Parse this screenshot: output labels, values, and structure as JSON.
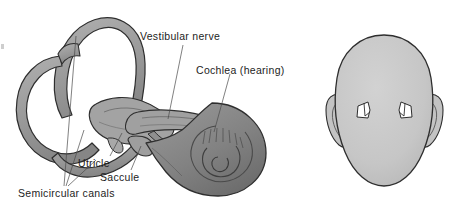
{
  "figure": {
    "width": 464,
    "height": 210,
    "background_color": "#ffffff"
  },
  "labels": {
    "vestibular_nerve": "Vestibular nerve",
    "cochlea": "Cochlea (hearing)",
    "utricle": "Utricle",
    "saccule": "Saccule",
    "semicircular_canals": "Semicircular canals"
  },
  "diagrams": {
    "inner_ear": {
      "name": "inner-ear-labyrinth",
      "parts": [
        "semicircular canals",
        "utricle",
        "saccule",
        "vestibular nerve",
        "cochlea"
      ]
    },
    "head": {
      "name": "head-rear-view",
      "parts": [
        "head outline",
        "left ear",
        "right ear",
        "left inner ear marker",
        "right inner ear marker"
      ]
    }
  },
  "colors": {
    "outline": "#2b2b2b",
    "canal_fill": "#9c9c9c",
    "canal_fill_light": "#b6b6b6",
    "cochlea_fill": "#8a8a8a",
    "cochlea_dark": "#6f6f6f",
    "head_fill": "#c6c6c6",
    "marker_fill": "#ffffff",
    "text": "#1d1d1d",
    "leader_line": "#4a4a4a"
  }
}
